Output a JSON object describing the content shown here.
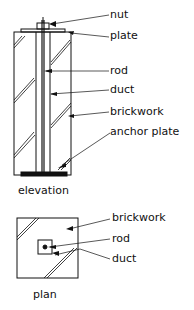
{
  "elevation": {
    "caption": "elevation",
    "labels": {
      "nut": "nut",
      "plate": "plate",
      "rod": "rod",
      "duct": "duct",
      "brickwork": "brickwork",
      "anchor_plate": "anchor plate"
    }
  },
  "plan": {
    "caption": "plan",
    "labels": {
      "brickwork": "brickwork",
      "rod": "rod",
      "duct": "duct"
    }
  },
  "colors": {
    "line": "#111111",
    "background": "#ffffff"
  }
}
